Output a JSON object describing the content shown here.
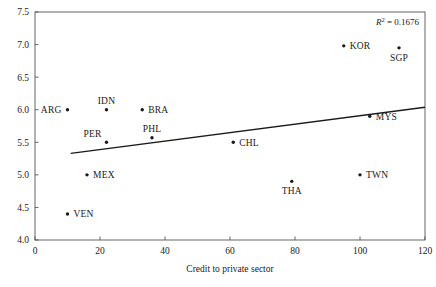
{
  "chart_data": {
    "type": "scatter",
    "title": "",
    "xlabel": "Credit to private sector",
    "ylabel": "",
    "xlim": [
      0,
      120
    ],
    "ylim": [
      4.0,
      7.5
    ],
    "xticks": [
      "0",
      "20",
      "40",
      "60",
      "80",
      "100",
      "120"
    ],
    "yticks": [
      "4.0",
      "4.5",
      "5.0",
      "5.5",
      "6.0",
      "6.5",
      "7.0",
      "7.5"
    ],
    "grid": false,
    "legend": "none",
    "annotation": "R² = 0.1676",
    "annotation_symbol": "R",
    "annotation_sup": "2",
    "annotation_rest": " = 0.1676",
    "points": [
      {
        "label": "ARG",
        "x": 10,
        "y": 6.0,
        "label_pos": "left"
      },
      {
        "label": "VEN",
        "x": 10,
        "y": 4.4,
        "label_pos": "right"
      },
      {
        "label": "MEX",
        "x": 16,
        "y": 5.0,
        "label_pos": "right"
      },
      {
        "label": "IDN",
        "x": 22,
        "y": 6.0,
        "label_pos": "above"
      },
      {
        "label": "PER",
        "x": 22,
        "y": 5.5,
        "label_pos": "above-left"
      },
      {
        "label": "BRA",
        "x": 33,
        "y": 6.0,
        "label_pos": "right"
      },
      {
        "label": "PHL",
        "x": 36,
        "y": 5.57,
        "label_pos": "above"
      },
      {
        "label": "CHL",
        "x": 61,
        "y": 5.5,
        "label_pos": "right"
      },
      {
        "label": "THA",
        "x": 79,
        "y": 4.9,
        "label_pos": "below"
      },
      {
        "label": "KOR",
        "x": 95,
        "y": 6.98,
        "label_pos": "right"
      },
      {
        "label": "TWN",
        "x": 100,
        "y": 5.0,
        "label_pos": "right"
      },
      {
        "label": "MYS",
        "x": 103,
        "y": 5.9,
        "label_pos": "right"
      },
      {
        "label": "SGP",
        "x": 112,
        "y": 6.95,
        "label_pos": "below"
      }
    ],
    "trendline": {
      "x0": 11,
      "y0": 5.33,
      "x1": 148,
      "y1": 6.22
    }
  },
  "colors": {
    "axis": "#555555",
    "marker": "#1a1a1a",
    "trendline": "#1a1a1a",
    "text": "#1a1a1a",
    "background": "#ffffff"
  }
}
